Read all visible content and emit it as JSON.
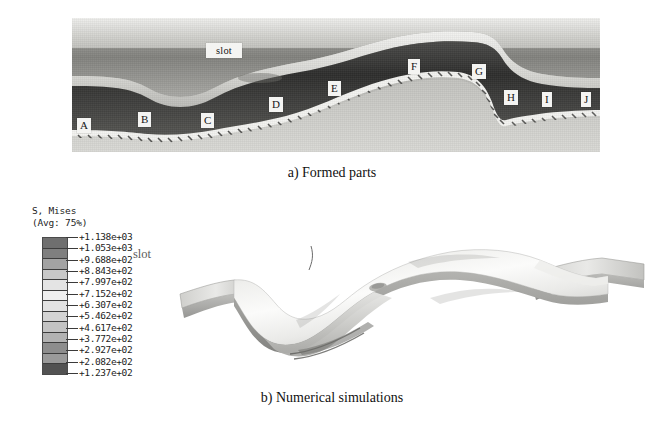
{
  "figure": {
    "panel_a": {
      "caption": "a) Formed parts",
      "slot_label": "slot",
      "callouts": [
        {
          "label": "A",
          "x": 5,
          "y": 100
        },
        {
          "label": "B",
          "x": 66,
          "y": 94
        },
        {
          "label": "C",
          "x": 129,
          "y": 95
        },
        {
          "label": "D",
          "x": 197,
          "y": 79
        },
        {
          "label": "E",
          "x": 256,
          "y": 63
        },
        {
          "label": "F",
          "x": 336,
          "y": 41
        },
        {
          "label": "G",
          "x": 400,
          "y": 46
        },
        {
          "label": "H",
          "x": 432,
          "y": 72
        },
        {
          "label": "I",
          "x": 470,
          "y": 74
        },
        {
          "label": "J",
          "x": 509,
          "y": 74
        }
      ]
    },
    "panel_b": {
      "caption": "b) Numerical simulations",
      "slot_label": "slot",
      "legend": {
        "title": "S, Mises",
        "avg": "(Avg: 75%)",
        "values": [
          "+1.138e+03",
          "+1.053e+03",
          "+9.688e+02",
          "+8.843e+02",
          "+7.997e+02",
          "+7.152e+02",
          "+6.307e+02",
          "+5.462e+02",
          "+4.617e+02",
          "+3.772e+02",
          "+2.927e+02",
          "+2.082e+02",
          "+1.237e+02"
        ],
        "band_colors": [
          "#6f6f6f",
          "#7f7f7f",
          "#a3a3a3",
          "#c8c8c8",
          "#e4e4e4",
          "#efefef",
          "#e2e2e2",
          "#d3d3d3",
          "#c3c3c3",
          "#b2b2b2",
          "#8d8d8d",
          "#9a9a9a",
          "#525252"
        ]
      }
    }
  },
  "chart_data": {
    "type": "heatmap",
    "title": "S, Mises",
    "subtitle": "(Avg: 75%)",
    "xlabel": "",
    "ylabel": "von Mises stress (MPa)",
    "colorbar_levels": [
      1138,
      1053,
      968.8,
      884.3,
      799.7,
      715.2,
      630.7,
      546.2,
      461.7,
      377.2,
      292.7,
      208.2,
      123.7
    ],
    "colorbar_level_text": [
      "+1.138e+03",
      "+1.053e+03",
      "+9.688e+02",
      "+8.843e+02",
      "+7.997e+02",
      "+7.152e+02",
      "+6.307e+02",
      "+5.462e+02",
      "+4.617e+02",
      "+3.772e+02",
      "+2.927e+02",
      "+2.082e+02",
      "+1.237e+02"
    ],
    "value_range": [
      123.7,
      1138.0
    ],
    "grid": false,
    "legend_position": "left",
    "annotations": [
      "slot",
      "A",
      "B",
      "C",
      "D",
      "E",
      "F",
      "G",
      "H",
      "I",
      "J"
    ],
    "panels": [
      {
        "name": "a",
        "label": "a) Formed parts",
        "kind": "photograph"
      },
      {
        "name": "b",
        "label": "b) Numerical simulations",
        "kind": "fe-contour"
      }
    ]
  }
}
